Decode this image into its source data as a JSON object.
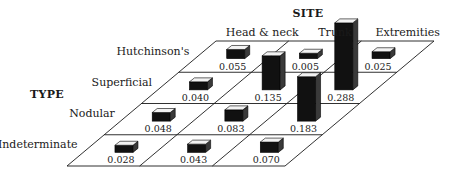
{
  "chart_data": {
    "type": "bar",
    "subtype": "3d-grid-bar",
    "title": "",
    "row_axis_title": "TYPE",
    "col_axis_title": "SITE",
    "columns": [
      "Head & neck",
      "Trunk",
      "Extremities"
    ],
    "rows": [
      "Hutchinson's",
      "Superficial",
      "Nodular",
      "Indeterminate"
    ],
    "values": [
      [
        0.055,
        0.005,
        0.025
      ],
      [
        0.04,
        0.135,
        0.288
      ],
      [
        0.048,
        0.083,
        0.183
      ],
      [
        0.028,
        0.043,
        0.07
      ]
    ],
    "value_labels": [
      [
        "0.055",
        "0.005",
        "0.025"
      ],
      [
        "0.040",
        "0.135",
        "0.288"
      ],
      [
        "0.048",
        "0.083",
        "0.183"
      ],
      [
        "0.028",
        "0.043",
        "0.070"
      ]
    ],
    "grid": true,
    "legend": "none",
    "colors": {
      "bar_front": "#111111",
      "bar_top": "#f2f2f2",
      "bar_side": "#3a3a3a",
      "grid": "#1a1a1a"
    }
  }
}
